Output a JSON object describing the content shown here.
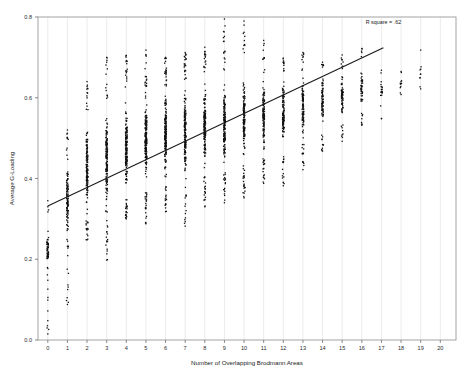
{
  "chart_data": {
    "type": "scatter",
    "title": "",
    "xlabel": "Number of Overlapping Brodmann Areas",
    "ylabel": "Average G-Loading",
    "xlim": [
      -0.5,
      20.8
    ],
    "ylim": [
      0.0,
      0.8
    ],
    "grid": "vertical",
    "legend": "none",
    "x_ticks": [
      0,
      1,
      2,
      3,
      4,
      5,
      6,
      7,
      8,
      9,
      10,
      11,
      12,
      13,
      14,
      15,
      16,
      17,
      18,
      19,
      20
    ],
    "x_tick_labels": [
      "0",
      "1",
      "2",
      "3",
      "4",
      "5",
      "6",
      "7",
      "8",
      "9",
      "10",
      "11",
      "12",
      "13",
      "14",
      "15",
      "16",
      "17",
      "18",
      "19",
      "20"
    ],
    "y_ticks": [
      0.0,
      0.2,
      0.4,
      0.6,
      0.8
    ],
    "y_tick_labels": [
      "0.0",
      "0.2",
      "0.4",
      "0.6",
      "0.8"
    ],
    "annotations": [
      {
        "name": "r-square-annotation",
        "text": "R square = .62",
        "x": 17.1,
        "y": 0.782
      }
    ],
    "fit_line": {
      "type": "linear",
      "slope": 0.0229,
      "intercept": 0.332,
      "x_start": 0.0,
      "x_end": 17.1,
      "y_start": 0.332,
      "y_end": 0.724,
      "color": "#1a1a1a",
      "width": 1.1
    },
    "marker": {
      "shape": "square",
      "size": 1.3,
      "color": "#111111"
    },
    "point_color": "#111111",
    "columns": [
      {
        "x": 0,
        "n": 58,
        "min": 0.015,
        "max": 0.36,
        "dense_lo": 0.185,
        "dense_hi": 0.265,
        "outliers": [
          0.015,
          0.048,
          0.072,
          0.099,
          0.126,
          0.148,
          0.33,
          0.345
        ]
      },
      {
        "x": 1,
        "n": 120,
        "min": 0.088,
        "max": 0.52,
        "dense_lo": 0.25,
        "dense_hi": 0.455,
        "outliers": [
          0.088,
          0.232,
          0.512,
          0.52
        ]
      },
      {
        "x": 2,
        "n": 150,
        "min": 0.248,
        "max": 0.64,
        "dense_lo": 0.3,
        "dense_hi": 0.56,
        "outliers": [
          0.248,
          0.262,
          0.628,
          0.64
        ]
      },
      {
        "x": 3,
        "n": 168,
        "min": 0.198,
        "max": 0.7,
        "dense_lo": 0.32,
        "dense_hi": 0.58,
        "outliers": [
          0.198,
          0.268,
          0.688,
          0.7
        ]
      },
      {
        "x": 4,
        "n": 190,
        "min": 0.3,
        "max": 0.705,
        "dense_lo": 0.35,
        "dense_hi": 0.6,
        "outliers": [
          0.3,
          0.318,
          0.692,
          0.705
        ]
      },
      {
        "x": 5,
        "n": 205,
        "min": 0.288,
        "max": 0.718,
        "dense_lo": 0.368,
        "dense_hi": 0.62,
        "outliers": [
          0.288,
          0.302,
          0.706,
          0.718
        ]
      },
      {
        "x": 6,
        "n": 196,
        "min": 0.318,
        "max": 0.7,
        "dense_lo": 0.38,
        "dense_hi": 0.628,
        "outliers": [
          0.318,
          0.336,
          0.69,
          0.7
        ]
      },
      {
        "x": 7,
        "n": 180,
        "min": 0.282,
        "max": 0.712,
        "dense_lo": 0.392,
        "dense_hi": 0.64,
        "outliers": [
          0.282,
          0.352,
          0.7,
          0.712
        ]
      },
      {
        "x": 8,
        "n": 186,
        "min": 0.33,
        "max": 0.725,
        "dense_lo": 0.405,
        "dense_hi": 0.65,
        "outliers": [
          0.33,
          0.348,
          0.714,
          0.725
        ]
      },
      {
        "x": 9,
        "n": 175,
        "min": 0.34,
        "max": 0.795,
        "dense_lo": 0.418,
        "dense_hi": 0.655,
        "outliers": [
          0.34,
          0.362,
          0.752,
          0.795
        ]
      },
      {
        "x": 10,
        "n": 160,
        "min": 0.352,
        "max": 0.79,
        "dense_lo": 0.432,
        "dense_hi": 0.66,
        "outliers": [
          0.352,
          0.376,
          0.762,
          0.79
        ]
      },
      {
        "x": 11,
        "n": 142,
        "min": 0.388,
        "max": 0.742,
        "dense_lo": 0.452,
        "dense_hi": 0.662,
        "outliers": [
          0.388,
          0.402,
          0.73,
          0.742
        ]
      },
      {
        "x": 12,
        "n": 128,
        "min": 0.382,
        "max": 0.698,
        "dense_lo": 0.47,
        "dense_hi": 0.664,
        "outliers": [
          0.382,
          0.412,
          0.688,
          0.698
        ]
      },
      {
        "x": 13,
        "n": 110,
        "min": 0.422,
        "max": 0.712,
        "dense_lo": 0.488,
        "dense_hi": 0.668,
        "outliers": [
          0.422,
          0.44,
          0.7,
          0.712
        ]
      },
      {
        "x": 14,
        "n": 80,
        "min": 0.468,
        "max": 0.688,
        "dense_lo": 0.52,
        "dense_hi": 0.668,
        "outliers": [
          0.468,
          0.484,
          0.676,
          0.688
        ]
      },
      {
        "x": 15,
        "n": 76,
        "min": 0.492,
        "max": 0.706,
        "dense_lo": 0.54,
        "dense_hi": 0.672,
        "outliers": [
          0.492,
          0.508,
          0.694,
          0.706
        ]
      },
      {
        "x": 16,
        "n": 48,
        "min": 0.532,
        "max": 0.722,
        "dense_lo": 0.566,
        "dense_hi": 0.69,
        "outliers": [
          0.532,
          0.548,
          0.712,
          0.722
        ]
      },
      {
        "x": 17,
        "n": 18,
        "min": 0.548,
        "max": 0.668,
        "dense_lo": 0.58,
        "dense_hi": 0.66,
        "outliers": [
          0.548,
          0.668
        ]
      },
      {
        "x": 18,
        "n": 10,
        "min": 0.608,
        "max": 0.665,
        "dense_lo": 0.612,
        "dense_hi": 0.662,
        "outliers": [
          0.608,
          0.665
        ]
      },
      {
        "x": 19,
        "n": 8,
        "min": 0.622,
        "max": 0.718,
        "dense_lo": 0.63,
        "dense_hi": 0.69,
        "outliers": [
          0.622,
          0.718
        ]
      },
      {
        "x": 20,
        "n": 0,
        "min": 0.0,
        "max": 0.0,
        "dense_lo": 0.0,
        "dense_hi": 0.0,
        "outliers": []
      }
    ]
  },
  "axes": {
    "x_title": "Number of Overlapping Brodmann Areas",
    "y_title": "Average G-Loading"
  },
  "annotation": {
    "r_square_text": "R square = .62"
  },
  "style": {
    "frame_color": "#9a9a9a",
    "gridline_color": "#e3e3e3",
    "background": "#ffffff"
  }
}
